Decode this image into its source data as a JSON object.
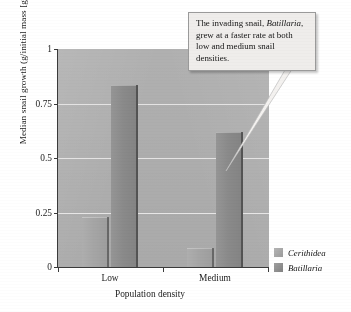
{
  "chart_data": {
    "type": "bar",
    "title": "",
    "xlabel": "Population density",
    "ylabel": "Median snail growth (g/initial mass [g])",
    "categories": [
      "Low",
      "Medium"
    ],
    "series": [
      {
        "name": "Cerithidea",
        "values": [
          0.23,
          0.085
        ],
        "color": "#a5a5a5"
      },
      {
        "name": "Batillaria",
        "values": [
          0.835,
          0.62
        ],
        "color": "#8a8a8a"
      }
    ],
    "ylim": [
      0,
      1
    ],
    "yticks": [
      "0",
      "0.25",
      "0.5",
      "0.75",
      "1"
    ],
    "ytick_values": [
      0,
      0.25,
      0.5,
      0.75,
      1
    ],
    "grid": true,
    "legend_position": "right-bottom",
    "plot_background": "#b0b0b0",
    "annotations": [
      {
        "text_parts": [
          {
            "text": "The invading snail, "
          },
          {
            "text": "Batillaria",
            "style": "italic"
          },
          {
            "text": ", grew at a faster rate at both low and medium snail densities."
          }
        ],
        "plain_text": "The invading snail, Batillaria, grew at a faster rate at both low and medium snail densities.",
        "points_to": "Batillaria bar at Medium density"
      }
    ]
  },
  "axis": {
    "y_title": "Median snail growth (g/initial mass [g])",
    "x_title": "Population density",
    "y_ticks": [
      "1",
      "0.75",
      "0.5",
      "0.25",
      "0"
    ],
    "x_ticks": [
      "Low",
      "Medium"
    ]
  },
  "legend": {
    "items": [
      {
        "label": "Cerithidea",
        "swatch": "light-gray"
      },
      {
        "label": "Batillaria",
        "swatch": "dark-gray"
      }
    ]
  },
  "callout": {
    "line1": "The invading snail,",
    "italic": "Batillaria",
    "line2": ", grew at a faster",
    "line3": "rate at both low and",
    "line4": "medium snail densities."
  }
}
